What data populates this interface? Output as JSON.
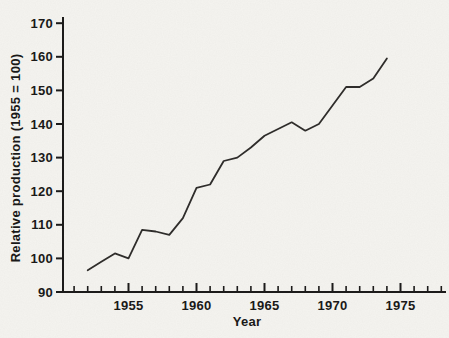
{
  "chart_data": {
    "type": "line",
    "title": "",
    "xlabel": "Year",
    "ylabel": "Relative production (1955 = 100)",
    "x": [
      1952,
      1953,
      1954,
      1955,
      1956,
      1957,
      1958,
      1959,
      1960,
      1961,
      1962,
      1963,
      1964,
      1965,
      1966,
      1967,
      1968,
      1969,
      1970,
      1971,
      1972,
      1973,
      1974
    ],
    "values": [
      96.5,
      99,
      101.5,
      100,
      108.5,
      108,
      107,
      112,
      121,
      122,
      129,
      130,
      133,
      136.5,
      138.5,
      140.5,
      138,
      140,
      145.5,
      151,
      151,
      153.5,
      159.5
    ],
    "series_name": "Relative production index",
    "xlim": [
      1950.2,
      1978.3
    ],
    "ylim": [
      90,
      170
    ],
    "y_ticks": [
      90,
      100,
      110,
      120,
      130,
      140,
      150,
      160,
      170
    ],
    "x_major_ticks": [
      1955,
      1960,
      1965,
      1970,
      1975
    ],
    "x_minor_tick_range": [
      1951,
      1978
    ],
    "grid": false,
    "legend": "none",
    "line_color": "#2f2d2b",
    "axis_color": "#1c1b1a",
    "text_color": "#1a1918",
    "background": "#f5f4f0"
  }
}
